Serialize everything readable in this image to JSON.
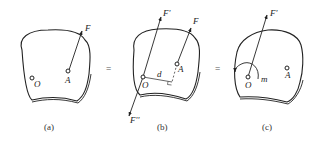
{
  "panels": [
    {
      "id": "a",
      "caption": "(a)",
      "points": [
        {
          "name": "O"
        },
        {
          "name": "A"
        }
      ],
      "forces": [
        {
          "label": "F"
        }
      ]
    },
    {
      "id": "b",
      "caption": "(b)",
      "points": [
        {
          "name": "O"
        },
        {
          "name": "A"
        }
      ],
      "forces": [
        {
          "label": "F'"
        },
        {
          "label": "F"
        },
        {
          "label": "F''"
        }
      ],
      "distance_label": "d"
    },
    {
      "id": "c",
      "caption": "(c)",
      "points": [
        {
          "name": "O"
        },
        {
          "name": "A"
        }
      ],
      "forces": [
        {
          "label": "F'"
        }
      ],
      "moment_label": "m"
    }
  ],
  "equals": [
    "=",
    "="
  ],
  "colors": {
    "stroke": "#222222",
    "background": "#ffffff"
  }
}
